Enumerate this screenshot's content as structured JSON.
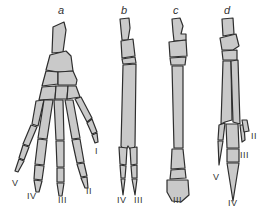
{
  "figure": {
    "colors": {
      "bone_fill": "#c9c9c9",
      "outline": "#2e2e2e",
      "background": "#ffffff",
      "text": "#333333"
    },
    "panels": [
      {
        "id": "a",
        "label": "a",
        "digits": [
          {
            "label": "V",
            "x": 15,
            "y": 186
          },
          {
            "label": "IV",
            "x": 32,
            "y": 199
          },
          {
            "label": "III",
            "x": 63,
            "y": 203
          },
          {
            "label": "II",
            "x": 89,
            "y": 194
          },
          {
            "label": "I",
            "x": 97,
            "y": 154
          }
        ]
      },
      {
        "id": "b",
        "label": "b",
        "digits": [
          {
            "label": "IV",
            "x": 122,
            "y": 203
          },
          {
            "label": "III",
            "x": 139,
            "y": 203
          }
        ]
      },
      {
        "id": "c",
        "label": "c",
        "digits": [
          {
            "label": "III",
            "x": 178,
            "y": 203
          }
        ]
      },
      {
        "id": "d",
        "label": "d",
        "digits": [
          {
            "label": "V",
            "x": 216,
            "y": 180
          },
          {
            "label": "IV",
            "x": 233,
            "y": 206
          },
          {
            "label": "III",
            "x": 245,
            "y": 158
          },
          {
            "label": "II",
            "x": 254,
            "y": 139
          }
        ]
      }
    ]
  }
}
